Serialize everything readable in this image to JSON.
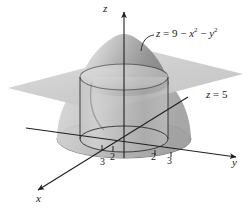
{
  "figure": {
    "name": "paraboloid-cylinder-plane-diagram",
    "background_color": "#ffffff",
    "ink_color": "#1a1a1a"
  },
  "axes": {
    "z": {
      "label": "z",
      "direction": "up"
    },
    "y": {
      "label": "y",
      "direction": "right"
    },
    "x": {
      "label": "x",
      "direction": "lower-left"
    }
  },
  "ticks": {
    "y_negative_outer": "3",
    "y_negative_inner": "2",
    "y_positive_inner": "2",
    "y_positive_outer": "3"
  },
  "labels": {
    "surface_lhs": "z",
    "surface_eq": " = 9 − ",
    "surface_x": "x",
    "surface_xexp": "2",
    "surface_minus": " − ",
    "surface_y": "y",
    "surface_yexp": "2",
    "plane_lhs": "z",
    "plane_rhs": " = 5"
  },
  "surfaces": {
    "paraboloid": {
      "equation": "z = 9 - x^2 - y^2",
      "apex_z": 9,
      "base_radius": 3,
      "fill_light": "#d8d8d8",
      "fill_dark": "#8d8d8d"
    },
    "plane": {
      "equation": "z = 5",
      "height": 5,
      "fill": "#cfcfcf"
    },
    "cylinder": {
      "radius": 2,
      "fill": "#c6c6c6",
      "edge": "#3a3a3a"
    },
    "base_disk": {
      "z": 0,
      "outer_radius": 3,
      "inner_radius": 2,
      "fill": "#c9c9c9"
    }
  },
  "colors": {
    "line": "#262626",
    "plane_gray": "#cfcfcf",
    "shade_light": "#e2e2e2",
    "shade_mid": "#b4b4b4",
    "shade_dark": "#828282"
  }
}
